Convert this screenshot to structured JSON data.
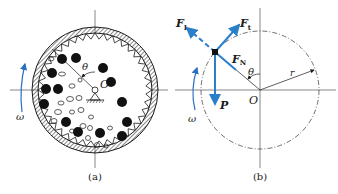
{
  "figure_a": {
    "caption": "(a)",
    "center_label": "O",
    "angle_label": "θ",
    "rotation_label": "ω"
  },
  "figure_b": {
    "caption": "(b)",
    "center_label": "O",
    "angle_label": "θ",
    "radius_label": "r",
    "rotation_label": "ω",
    "forces": {
      "inertia_dashed": "F",
      "inertia_dashed_sub": "I",
      "tangential": "F",
      "tangential_sub": "t",
      "normal": "F",
      "normal_sub": "N",
      "weight": "P"
    }
  },
  "colors": {
    "line": "#1a1a1a",
    "force": "#2a7fc9",
    "omega": "#2a6fc0"
  }
}
